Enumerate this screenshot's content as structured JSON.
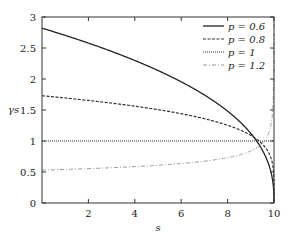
{
  "chart_data": {
    "type": "line",
    "title": "",
    "xlabel": "s",
    "ylabel": "γs",
    "xlim": [
      0,
      10
    ],
    "ylim": [
      0,
      3
    ],
    "xticks": [
      2,
      4,
      6,
      8,
      10
    ],
    "yticks": [
      0,
      0.5,
      1,
      1.5,
      2,
      2.5,
      3
    ],
    "ytick_labels": [
      "0",
      "0.5",
      "1",
      "1.5",
      "2",
      "2.5",
      "3"
    ],
    "grid": false,
    "legend_position": "upper right",
    "series": [
      {
        "name": "p = 0.6",
        "style": "solid",
        "gamma0": 2.82,
        "exponent": 0.4,
        "x": [
          0,
          2,
          4,
          6,
          8,
          9,
          9.5,
          9.9,
          10
        ],
        "y": [
          2.82,
          2.58,
          2.31,
          1.96,
          1.48,
          1.12,
          0.86,
          0.45,
          0.1
        ]
      },
      {
        "name": "p = 0.8",
        "style": "dashed",
        "gamma0": 1.73,
        "exponent": 0.2,
        "x": [
          0,
          2,
          4,
          6,
          8,
          9,
          9.5,
          9.9,
          10
        ],
        "y": [
          1.73,
          1.65,
          1.56,
          1.44,
          1.26,
          1.09,
          0.95,
          0.69,
          0.2
        ]
      },
      {
        "name": "p = 1",
        "style": "dotted",
        "gamma0": 1.0,
        "exponent": 0,
        "x": [
          0,
          10
        ],
        "y": [
          1,
          1
        ]
      },
      {
        "name": "p = 1.2",
        "style": "dash-dot",
        "gamma0": 0.53,
        "exponent": -0.2,
        "x": [
          0,
          2,
          4,
          6,
          8,
          9,
          9.5,
          9.9,
          10
        ],
        "y": [
          0.53,
          0.55,
          0.59,
          0.64,
          0.73,
          0.84,
          0.97,
          1.33,
          1.95
        ]
      }
    ]
  }
}
